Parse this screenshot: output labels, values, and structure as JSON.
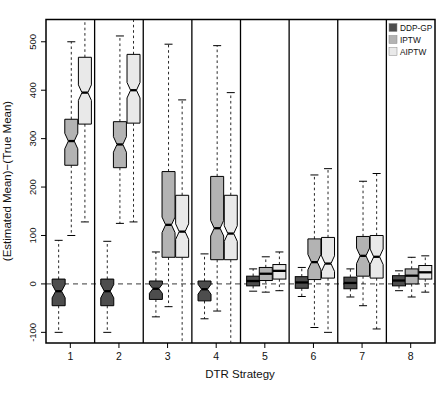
{
  "chart_data": {
    "type": "boxplot",
    "title": "",
    "xlabel": "DTR Strategy",
    "ylabel": "(Estimated Mean)−(True Mean)",
    "x_categories": [
      "1",
      "2",
      "3",
      "4",
      "5",
      "6",
      "7",
      "8"
    ],
    "yticks": [
      -100,
      0,
      100,
      200,
      300,
      400,
      500
    ],
    "ylim": [
      -122,
      546
    ],
    "zero_reference_line": 0,
    "grid": false,
    "notched": true,
    "panel_separators": true,
    "legend": {
      "position": "top-right",
      "entries": [
        {
          "label": "DDP-GP",
          "color": "#4d4d4d"
        },
        {
          "label": "IPTW",
          "color": "#b3b3b3"
        },
        {
          "label": "AIPTW",
          "color": "#e9e9e9"
        }
      ]
    },
    "series": [
      {
        "name": "DDP-GP",
        "color": "#4d4d4d",
        "boxes": [
          {
            "strategy": "1",
            "lo": -100,
            "q1": -45,
            "med": -15,
            "q3": 10,
            "hi": 90
          },
          {
            "strategy": "2",
            "lo": -100,
            "q1": -45,
            "med": -15,
            "q3": 10,
            "hi": 88
          },
          {
            "strategy": "3",
            "lo": -68,
            "q1": -32,
            "med": -10,
            "q3": 6,
            "hi": 66
          },
          {
            "strategy": "4",
            "lo": -72,
            "q1": -35,
            "med": -11,
            "q3": 6,
            "hi": 62
          },
          {
            "strategy": "5",
            "lo": -15,
            "q1": -4,
            "med": 6,
            "q3": 16,
            "hi": 31
          },
          {
            "strategy": "6",
            "lo": -26,
            "q1": -9,
            "med": 3,
            "q3": 15,
            "hi": 34
          },
          {
            "strategy": "7",
            "lo": -27,
            "q1": -10,
            "med": 2,
            "q3": 14,
            "hi": 31
          },
          {
            "strategy": "8",
            "lo": -14,
            "q1": -4,
            "med": 7,
            "q3": 17,
            "hi": 27
          }
        ]
      },
      {
        "name": "IPTW",
        "color": "#b3b3b3",
        "boxes": [
          {
            "strategy": "1",
            "lo": 100,
            "q1": 245,
            "med": 295,
            "q3": 340,
            "hi": 500
          },
          {
            "strategy": "2",
            "lo": 125,
            "q1": 240,
            "med": 288,
            "q3": 335,
            "hi": 512
          },
          {
            "strategy": "3",
            "lo": -47,
            "q1": 55,
            "med": 122,
            "q3": 232,
            "hi": 495
          },
          {
            "strategy": "4",
            "lo": -56,
            "q1": 50,
            "med": 115,
            "q3": 222,
            "hi": 492
          },
          {
            "strategy": "5",
            "lo": -17,
            "q1": 7,
            "med": 21,
            "q3": 34,
            "hi": 56
          },
          {
            "strategy": "6",
            "lo": -90,
            "q1": 9,
            "med": 45,
            "q3": 93,
            "hi": 225
          },
          {
            "strategy": "7",
            "lo": -45,
            "q1": 16,
            "med": 58,
            "q3": 98,
            "hi": 212
          },
          {
            "strategy": "8",
            "lo": -27,
            "q1": 0,
            "med": 17,
            "q3": 31,
            "hi": 55
          }
        ]
      },
      {
        "name": "AIPTW",
        "color": "#e9e9e9",
        "boxes": [
          {
            "strategy": "1",
            "lo": 128,
            "q1": 330,
            "med": 395,
            "q3": 468,
            "hi": 560
          },
          {
            "strategy": "2",
            "lo": 128,
            "q1": 332,
            "med": 400,
            "q3": 474,
            "hi": 560
          },
          {
            "strategy": "3",
            "lo": -140,
            "q1": 55,
            "med": 108,
            "q3": 183,
            "hi": 380
          },
          {
            "strategy": "4",
            "lo": -140,
            "q1": 50,
            "med": 104,
            "q3": 183,
            "hi": 395
          },
          {
            "strategy": "5",
            "lo": -14,
            "q1": 10,
            "med": 27,
            "q3": 40,
            "hi": 66
          },
          {
            "strategy": "6",
            "lo": -100,
            "q1": 12,
            "med": 42,
            "q3": 96,
            "hi": 238
          },
          {
            "strategy": "7",
            "lo": -93,
            "q1": 12,
            "med": 56,
            "q3": 100,
            "hi": 228
          },
          {
            "strategy": "8",
            "lo": -17,
            "q1": 10,
            "med": 24,
            "q3": 38,
            "hi": 58
          }
        ]
      }
    ]
  }
}
